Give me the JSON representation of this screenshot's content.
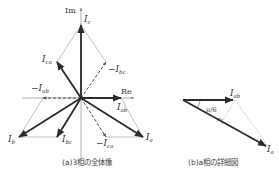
{
  "panel_a": {
    "caption": "(a)3相の全体像",
    "axes": {
      "imag": "Im",
      "real": "Re"
    },
    "vectors": [
      {
        "name": "I_c",
        "label": "I",
        "sub": "c",
        "style": "thick"
      },
      {
        "name": "I_ca",
        "label": "I",
        "sub": "ca",
        "style": "thick"
      },
      {
        "name": "-I_bc",
        "label": "−I",
        "sub": "bc",
        "style": "dashed"
      },
      {
        "name": "-I_ab",
        "label": "−I",
        "sub": "ab",
        "style": "dashed"
      },
      {
        "name": "I_ab",
        "label": "I",
        "sub": "ab",
        "style": "thick"
      },
      {
        "name": "I_b",
        "label": "I",
        "sub": "b",
        "style": "thick"
      },
      {
        "name": "I_bc",
        "label": "I",
        "sub": "bc",
        "style": "thick"
      },
      {
        "name": "-I_ca",
        "label": "−I",
        "sub": "ca",
        "style": "dashed"
      },
      {
        "name": "I_a",
        "label": "I",
        "sub": "a",
        "style": "thick"
      }
    ]
  },
  "panel_b": {
    "caption": "(b)a相の詳細図",
    "angle_label": "π/6",
    "vectors": [
      {
        "name": "I_ab",
        "label": "I",
        "sub": "ab"
      },
      {
        "name": "I_a",
        "label": "I",
        "sub": "a"
      }
    ]
  },
  "colors": {
    "thick": "#2b2b2b",
    "thin": "#9a9a9a",
    "axis": "#8a8a8a"
  }
}
